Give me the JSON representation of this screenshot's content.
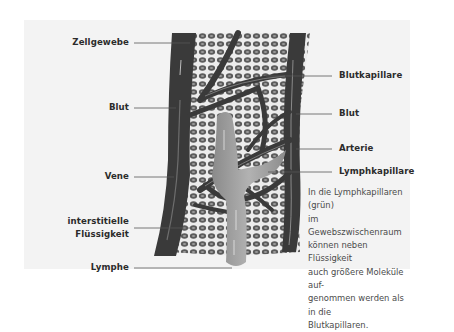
{
  "diagram": {
    "type": "anatomical illustration",
    "colors": {
      "background": "#ffffff",
      "panel": "#f3f3f3",
      "vessel": "#3a3a3a",
      "vessel_highlight": "#6e6e6e",
      "lymph": "#9a9a9a",
      "cell_fill": "#5a5a5a",
      "cell_bg": "#e8e8e8",
      "label_text": "#2b2b2b",
      "caption_text": "#4a4a4a"
    }
  },
  "labels_left": [
    {
      "id": "zellgewebe",
      "text": "Zellgewebe"
    },
    {
      "id": "blut_left",
      "text": "Blut"
    },
    {
      "id": "vene",
      "text": "Vene"
    },
    {
      "id": "interstitielle_line1",
      "text": "interstitielle"
    },
    {
      "id": "interstitielle_line2",
      "text": "Flüssigkeit"
    },
    {
      "id": "lymphe",
      "text": "Lymphe"
    }
  ],
  "labels_right": [
    {
      "id": "blutkapillare",
      "text": "Blutkapillare"
    },
    {
      "id": "blut_right",
      "text": "Blut"
    },
    {
      "id": "arterie",
      "text": "Arterie"
    },
    {
      "id": "lymphkapillare",
      "text": "Lymphkapillare"
    }
  ],
  "caption": {
    "lines": [
      "In die Lymphkapillaren (grün)",
      "im Gewebszwischenraum",
      "können neben Flüssigkeit",
      "auch größere Moleküle auf-",
      "genommen werden als in die",
      "Blutkapillaren."
    ]
  }
}
